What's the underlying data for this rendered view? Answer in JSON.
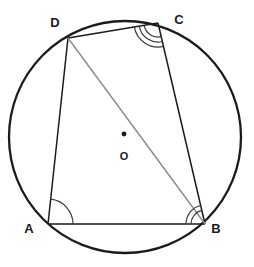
{
  "figure": {
    "background_color": "#ffffff",
    "stroke_color": "#1b1b1b",
    "diagonal_color": "#8d8d8d",
    "arc_mark_color": "#3a3a3a",
    "circle": {
      "label": "circumscribed-circle",
      "cx": 125,
      "cy": 137,
      "r": 116,
      "stroke_width": 2.3
    },
    "centre": {
      "label": "O",
      "dot_x": 124,
      "dot_y": 134,
      "dot_r": 2.4,
      "label_x": 124,
      "label_y": 156
    },
    "vertices": [
      {
        "name": "A",
        "label": "A",
        "x": 48,
        "y": 224,
        "label_x": 29,
        "label_y": 228,
        "angle_arcs": 1
      },
      {
        "name": "B",
        "label": "B",
        "x": 205,
        "y": 224,
        "label_x": 216,
        "label_y": 228,
        "angle_arcs": 2
      },
      {
        "name": "C",
        "label": "C",
        "x": 158,
        "y": 23,
        "label_x": 179,
        "label_y": 19,
        "angle_arcs": 3
      },
      {
        "name": "D",
        "label": "D",
        "x": 68,
        "y": 38,
        "label_x": 55,
        "label_y": 22,
        "angle_arcs": 0
      }
    ],
    "sides": [
      {
        "name": "side-AB",
        "from": "A",
        "to": "B"
      },
      {
        "name": "side-BC",
        "from": "B",
        "to": "C"
      },
      {
        "name": "side-CD",
        "from": "C",
        "to": "D"
      },
      {
        "name": "side-DA",
        "from": "D",
        "to": "A"
      }
    ],
    "diagonals": [
      {
        "name": "diagonal-DB",
        "from": "D",
        "to": "B",
        "color": "#8d8d8d"
      }
    ]
  }
}
